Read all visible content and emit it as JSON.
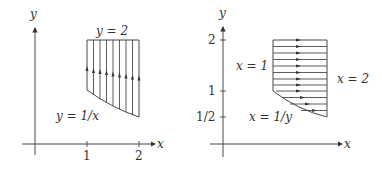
{
  "left": {
    "axis_x_label": "x",
    "axis_y_label": "y",
    "tick_labels": [
      "1",
      "2"
    ],
    "top_label": "y = 2",
    "curve_label": "y = 1/x"
  },
  "right": {
    "axis_x_label": "x",
    "axis_y_label": "y",
    "tick_labels": [
      "2",
      "1",
      "1/2"
    ],
    "left_label": "x = 1",
    "right_label": "x = 2",
    "curve_label": "x = 1/y"
  },
  "colors": {
    "stroke": "#333333",
    "background": "#ffffff"
  }
}
